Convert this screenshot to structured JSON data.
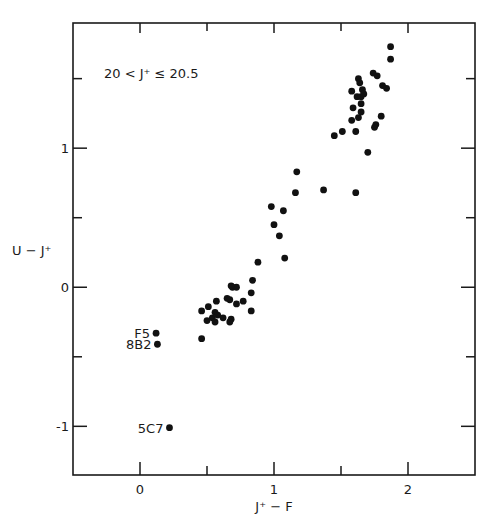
{
  "chart_data": {
    "type": "scatter",
    "title": "",
    "annotation": "20 < J⁺ ≤ 20.5",
    "xlabel": "J⁺ − F",
    "ylabel": "U − J⁺",
    "xlim": [
      -0.5,
      2.5
    ],
    "ylim": [
      -1.35,
      1.9
    ],
    "xticks_major": [
      0,
      1,
      2
    ],
    "xticks_minor": [
      0.5,
      1.5
    ],
    "xtick_labels": [
      "0",
      "1",
      "2"
    ],
    "yticks_major": [
      -1,
      0,
      1
    ],
    "yticks_minor": [
      -0.5,
      0.5,
      1.5
    ],
    "ytick_labels": [
      "-1",
      "0",
      "1"
    ],
    "grid": false,
    "legend": null,
    "marker_color": "#111111",
    "labeled_points": [
      {
        "label": "F5",
        "x": 0.12,
        "y": -0.33
      },
      {
        "label": "8B2",
        "x": 0.13,
        "y": -0.41
      },
      {
        "label": "5C7",
        "x": 0.22,
        "y": -1.01
      }
    ],
    "points": [
      {
        "x": 1.87,
        "y": 1.73
      },
      {
        "x": 1.87,
        "y": 1.64
      },
      {
        "x": 1.74,
        "y": 1.54
      },
      {
        "x": 1.77,
        "y": 1.52
      },
      {
        "x": 1.81,
        "y": 1.45
      },
      {
        "x": 1.84,
        "y": 1.43
      },
      {
        "x": 1.63,
        "y": 1.5
      },
      {
        "x": 1.64,
        "y": 1.47
      },
      {
        "x": 1.58,
        "y": 1.41
      },
      {
        "x": 1.66,
        "y": 1.42
      },
      {
        "x": 1.62,
        "y": 1.37
      },
      {
        "x": 1.65,
        "y": 1.37
      },
      {
        "x": 1.67,
        "y": 1.39
      },
      {
        "x": 1.65,
        "y": 1.32
      },
      {
        "x": 1.59,
        "y": 1.29
      },
      {
        "x": 1.65,
        "y": 1.26
      },
      {
        "x": 1.58,
        "y": 1.2
      },
      {
        "x": 1.63,
        "y": 1.22
      },
      {
        "x": 1.61,
        "y": 1.12
      },
      {
        "x": 1.8,
        "y": 1.23
      },
      {
        "x": 1.76,
        "y": 1.17
      },
      {
        "x": 1.75,
        "y": 1.15
      },
      {
        "x": 1.51,
        "y": 1.12
      },
      {
        "x": 1.45,
        "y": 1.09
      },
      {
        "x": 1.7,
        "y": 0.97
      },
      {
        "x": 1.17,
        "y": 0.83
      },
      {
        "x": 1.16,
        "y": 0.68
      },
      {
        "x": 1.37,
        "y": 0.7
      },
      {
        "x": 1.61,
        "y": 0.68
      },
      {
        "x": 0.98,
        "y": 0.58
      },
      {
        "x": 1.07,
        "y": 0.55
      },
      {
        "x": 1.0,
        "y": 0.45
      },
      {
        "x": 1.04,
        "y": 0.37
      },
      {
        "x": 1.08,
        "y": 0.21
      },
      {
        "x": 0.88,
        "y": 0.18
      },
      {
        "x": 0.84,
        "y": 0.05
      },
      {
        "x": 0.83,
        "y": -0.04
      },
      {
        "x": 0.83,
        "y": -0.17
      },
      {
        "x": 0.69,
        "y": 0.0
      },
      {
        "x": 0.72,
        "y": 0.0
      },
      {
        "x": 0.77,
        "y": -0.1
      },
      {
        "x": 0.72,
        "y": -0.12
      },
      {
        "x": 0.67,
        "y": -0.09
      },
      {
        "x": 0.65,
        "y": -0.08
      },
      {
        "x": 0.68,
        "y": 0.01
      },
      {
        "x": 0.57,
        "y": -0.1
      },
      {
        "x": 0.51,
        "y": -0.14
      },
      {
        "x": 0.46,
        "y": -0.17
      },
      {
        "x": 0.54,
        "y": -0.22
      },
      {
        "x": 0.56,
        "y": -0.18
      },
      {
        "x": 0.58,
        "y": -0.2
      },
      {
        "x": 0.5,
        "y": -0.24
      },
      {
        "x": 0.56,
        "y": -0.25
      },
      {
        "x": 0.62,
        "y": -0.22
      },
      {
        "x": 0.68,
        "y": -0.23
      },
      {
        "x": 0.67,
        "y": -0.25
      },
      {
        "x": 0.46,
        "y": -0.37
      },
      {
        "x": 0.12,
        "y": -0.33
      },
      {
        "x": 0.13,
        "y": -0.41
      },
      {
        "x": 0.22,
        "y": -1.01
      }
    ]
  }
}
